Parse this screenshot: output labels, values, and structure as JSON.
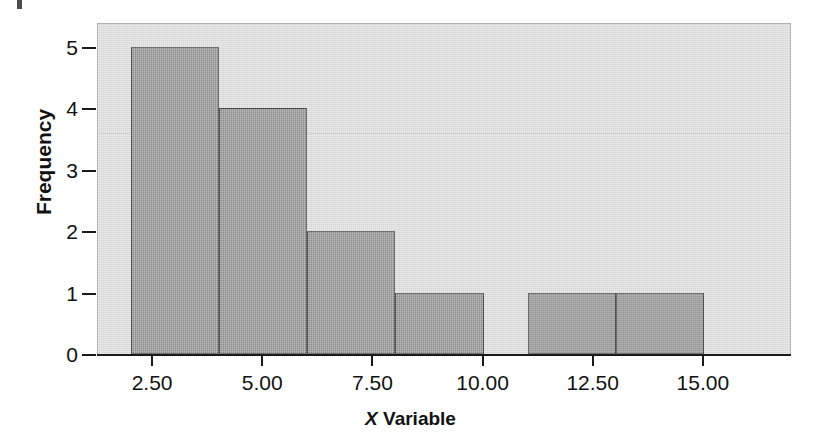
{
  "chart_data": {
    "type": "bar",
    "title": "",
    "subtitle": "",
    "xlabel_italic": "X",
    "xlabel_rest": " Variable",
    "xlabel": "X Variable",
    "ylabel": "Frequency",
    "xlim": [
      1.25,
      17.0
    ],
    "ylim": [
      0,
      5.4
    ],
    "grid": false,
    "legend": null,
    "x_tick_labels": [
      "2.50",
      "5.00",
      "7.50",
      "10.00",
      "12.50",
      "15.00"
    ],
    "x_tick_values": [
      2.5,
      5.0,
      7.5,
      10.0,
      12.5,
      15.0
    ],
    "y_tick_labels": [
      "0",
      "1",
      "2",
      "3",
      "4",
      "5"
    ],
    "y_tick_values": [
      0,
      1,
      2,
      3,
      4,
      5
    ],
    "bin_width": 2.0,
    "bins": [
      {
        "label": "2.00-4.00",
        "x0": 2.0,
        "x1": 4.0,
        "value": 5
      },
      {
        "label": "4.00-6.00",
        "x0": 4.0,
        "x1": 6.0,
        "value": 4
      },
      {
        "label": "6.00-8.00",
        "x0": 6.0,
        "x1": 8.0,
        "value": 2
      },
      {
        "label": "8.00-10.00",
        "x0": 8.0,
        "x1": 10.0,
        "value": 1
      },
      {
        "label": "11.00-13.00",
        "x0": 11.0,
        "x1": 13.0,
        "value": 1
      },
      {
        "label": "13.00-15.00",
        "x0": 13.0,
        "x1": 15.0,
        "value": 1
      }
    ],
    "categories": [
      "2.00-4.00",
      "4.00-6.00",
      "6.00-8.00",
      "8.00-10.00",
      "11.00-13.00",
      "13.00-15.00"
    ],
    "values": [
      5,
      4,
      2,
      1,
      1,
      1
    ],
    "colors": {
      "bar_fill": "#8c8c8c",
      "bar_edge": "#353535",
      "plot_background": "#dddddd",
      "plot_border": "#b3b3b3",
      "axis": "#1a1a1a",
      "text": "#111111",
      "page_background": "#ffffff"
    }
  }
}
